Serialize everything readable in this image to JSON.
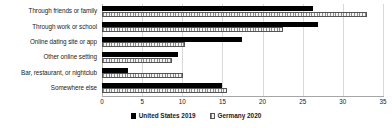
{
  "chart_data": {
    "type": "bar",
    "orientation": "horizontal",
    "title": "",
    "xlabel": "",
    "ylabel": "",
    "xlim": [
      0,
      35
    ],
    "xticks": [
      0,
      5,
      10,
      15,
      20,
      25,
      30,
      35
    ],
    "xtick_labels": [
      "0",
      "5",
      "10",
      "15",
      "20",
      "25",
      "30",
      "35"
    ],
    "grid": true,
    "legend_position": "bottom",
    "categories": [
      "Through friends or family",
      "Through work or school",
      "Online dating site or app",
      "Other online setting",
      "Bar, restaurant, or nightclub",
      "Somewhere else"
    ],
    "series": [
      {
        "name": "United States 2019",
        "color": "#000000",
        "values": [
          26.3,
          26.9,
          17.4,
          9.5,
          3.2,
          15.0
        ]
      },
      {
        "name": "Germany  2020",
        "color": "#f2f2f2",
        "values": [
          33.0,
          22.5,
          10.3,
          8.7,
          10.1,
          15.6
        ]
      }
    ]
  },
  "legend": {
    "items": [
      {
        "label": "United States 2019",
        "swatch": "solid-black-swatch"
      },
      {
        "label": "Germany  2020",
        "swatch": "hatched-swatch"
      }
    ]
  }
}
